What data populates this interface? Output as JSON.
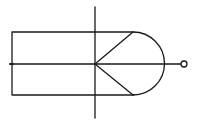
{
  "diagram": {
    "background": "#ffffff",
    "stroke_color": "#1a1a1a",
    "shapes": {
      "body_rect": {
        "x1": 12,
        "y1": 32,
        "x2": 133,
        "y2": 95
      },
      "arc": {
        "start": [
          133,
          32
        ],
        "end": [
          133,
          95
        ],
        "radius": 31.5
      },
      "axis_horizontal": {
        "x1": 11,
        "y1": 64,
        "x2": 181,
        "y2": 64
      },
      "axis_vertical": {
        "x1": 95,
        "y1": 7,
        "x2": 95,
        "y2": 118
      },
      "chevron": {
        "points": [
          [
            133,
            32
          ],
          [
            95,
            64
          ],
          [
            133,
            95
          ]
        ]
      },
      "terminal_circle": {
        "cx": 184,
        "cy": 64,
        "r": 3
      }
    }
  }
}
